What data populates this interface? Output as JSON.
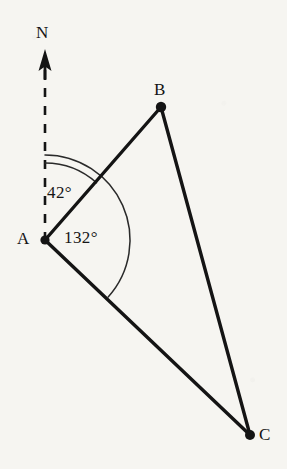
{
  "figure": {
    "background_color": "#f6f5f1",
    "stroke_color": "#141414",
    "text_color": "#141414",
    "width": 287,
    "height": 469
  },
  "labels": {
    "north": "N",
    "vertex_a": "A",
    "vertex_b": "B",
    "vertex_c": "C",
    "angle_bearing": "42°",
    "angle_interior": "132°"
  },
  "chart_data": {
    "type": "diagram",
    "subtype": "geometry-bearing-triangle",
    "points": [
      {
        "name": "A",
        "x": 45,
        "y": 240,
        "label": "A",
        "label_x": 24,
        "label_y": 240,
        "marker": "filled-dot"
      },
      {
        "name": "B",
        "x": 161,
        "y": 107,
        "label": "B",
        "label_x": 161,
        "label_y": 90,
        "marker": "filled-dot"
      },
      {
        "name": "C",
        "x": 250,
        "y": 435,
        "label": "C",
        "label_x": 266,
        "label_y": 436,
        "marker": "filled-dot"
      }
    ],
    "segments": [
      {
        "name": "AB",
        "from": "A",
        "to": "B",
        "style": "solid",
        "width": 3.4
      },
      {
        "name": "BC",
        "from": "B",
        "to": "C",
        "style": "solid",
        "width": 3.4
      },
      {
        "name": "AC",
        "from": "A",
        "to": "C",
        "style": "solid",
        "width": 3.4
      }
    ],
    "north_arrow": {
      "label": "N",
      "x": 45,
      "tip_y": 50,
      "base_y": 240,
      "head_bottom_y": 70,
      "style": "dashed-shaft-solid-head",
      "dash_pattern": "9 9"
    },
    "angles": [
      {
        "name": "bearing-of-B-from-A",
        "vertex": "A",
        "value": 42,
        "unit": "degrees",
        "label": "42°",
        "from_ray": "north",
        "to_ray": "AB",
        "start_deg_from_north": 0,
        "end_deg_from_north": 42,
        "arc_radius": 77,
        "label_x": 62,
        "label_y": 194
      },
      {
        "name": "bearing-of-C-from-A",
        "vertex": "A",
        "value": 132,
        "unit": "degrees",
        "label": "132°",
        "from_ray": "north",
        "to_ray": "AC",
        "start_deg_from_north": 0,
        "end_deg_from_north": 132,
        "arc_radius": 85,
        "label_x": 92,
        "label_y": 240
      }
    ]
  }
}
